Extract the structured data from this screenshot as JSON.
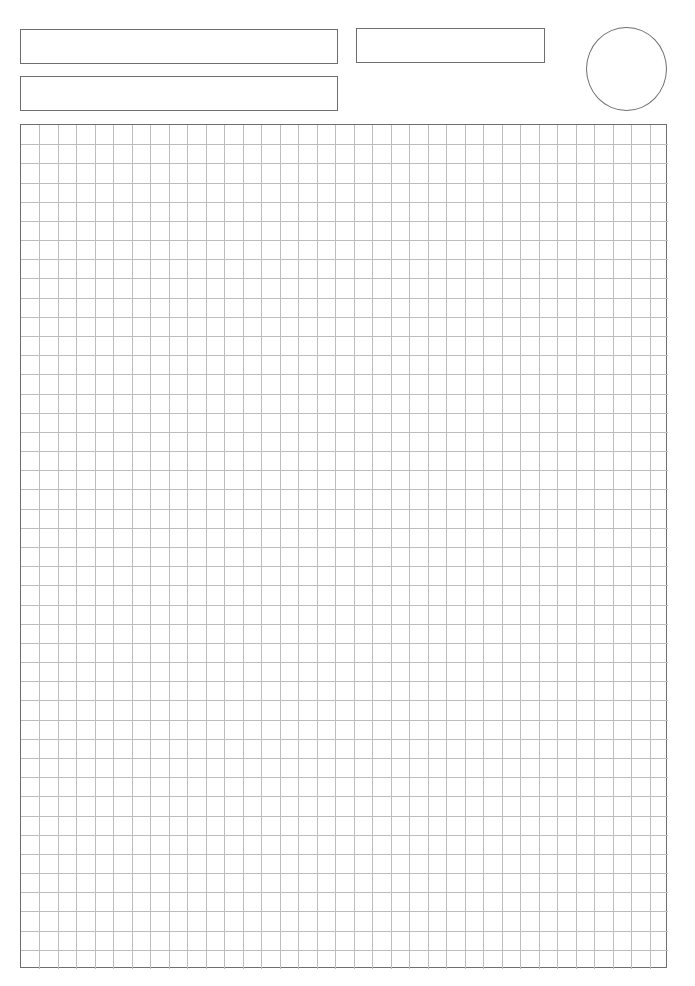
{
  "page": {
    "type": "graph-paper-worksheet",
    "background": "#ffffff"
  },
  "header": {
    "fields": [
      {
        "id": "field-1",
        "label": "",
        "value": "",
        "x": 20,
        "y": 29,
        "width": 318,
        "height": 35
      },
      {
        "id": "field-2",
        "label": "",
        "value": "",
        "x": 20,
        "y": 76,
        "width": 318,
        "height": 35
      },
      {
        "id": "field-3",
        "label": "",
        "value": "",
        "x": 356,
        "y": 28,
        "width": 189,
        "height": 35
      }
    ],
    "circle": {
      "x": 586,
      "y": 27,
      "width": 81,
      "height": 84
    }
  },
  "grid": {
    "x": 20,
    "y": 124,
    "width": 647,
    "height": 844,
    "columns": 35,
    "rows": 44,
    "border_color": "#6e6e6e",
    "line_color": "#bdbdbd"
  }
}
